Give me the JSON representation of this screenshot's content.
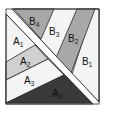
{
  "diagram": {
    "type": "quilt-block-piecing",
    "colors": {
      "background": "#ffffff",
      "outline": "#2a2a2a",
      "white_piece": "#f4f4f4",
      "light_gray": "#d0d0d0",
      "mid_gray": "#a8a8a8",
      "dark": "#3a3a3a"
    },
    "pieces": [
      {
        "id": "A1",
        "letter": "A",
        "num": "1",
        "fill": "white_piece"
      },
      {
        "id": "A2",
        "letter": "A",
        "num": "2",
        "fill": "light_gray"
      },
      {
        "id": "A3",
        "letter": "A",
        "num": "3",
        "fill": "white_piece"
      },
      {
        "id": "A4",
        "letter": "A",
        "num": "4",
        "fill": "dark"
      },
      {
        "id": "B1",
        "letter": "B",
        "num": "1",
        "fill": "white_piece"
      },
      {
        "id": "B2",
        "letter": "B",
        "num": "2",
        "fill": "mid_gray"
      },
      {
        "id": "B3",
        "letter": "B",
        "num": "3",
        "fill": "white_piece"
      },
      {
        "id": "B4",
        "letter": "B",
        "num": "4",
        "fill": "mid_gray"
      }
    ]
  }
}
